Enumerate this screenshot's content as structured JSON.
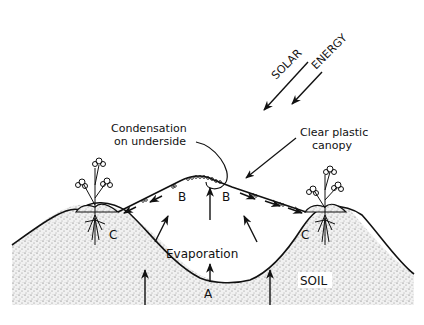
{
  "diagram": {
    "labels": {
      "solar": "SOLAR",
      "energy": "ENERGY",
      "condensation_line1": "Condensation",
      "condensation_line2": "on underside",
      "canopy_line1": "Clear plastic",
      "canopy_line2": "canopy",
      "evaporation": "Evaporation",
      "soil": "SOIL",
      "point_a": "A",
      "point_b_left": "B",
      "point_b_right": "B",
      "point_c_left": "C",
      "point_c_right": "C"
    },
    "colors": {
      "ink": "#111111",
      "background": "#ffffff",
      "soil_stipple": "#e6e6e6"
    }
  }
}
